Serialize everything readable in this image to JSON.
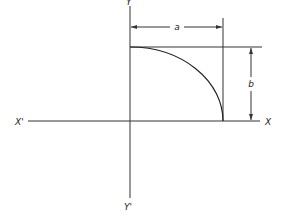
{
  "diagram": {
    "axes": {
      "x_positive_label": "X",
      "x_negative_label": "X'",
      "y_positive_label": "Y",
      "y_negative_label": "Y'"
    },
    "dimensions": {
      "horizontal_label": "a",
      "vertical_label": "b"
    },
    "curve": "quarter-ellipse arc from (0,b) to (a,0) in first quadrant",
    "colors": {
      "line": "#222222",
      "background": "#ffffff"
    }
  }
}
